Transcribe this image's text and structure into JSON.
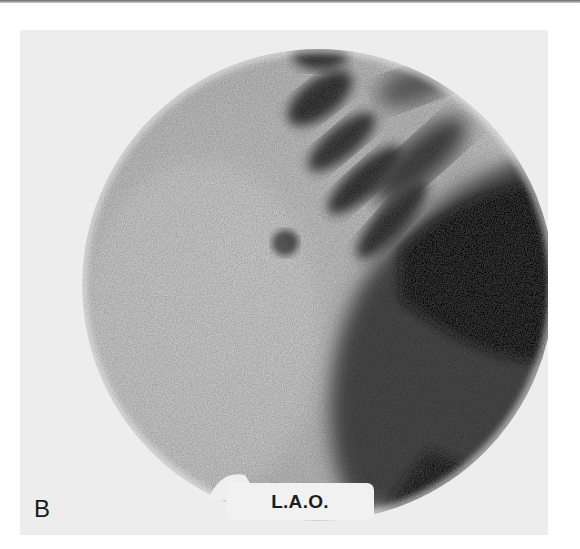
{
  "figure": {
    "panel_label": "B",
    "view_label": "L.A.O."
  },
  "colors": {
    "background": "#ffffff",
    "panel": "#ededed",
    "tissue_light": "#d4d4d4",
    "tissue_dark": "#141414"
  }
}
